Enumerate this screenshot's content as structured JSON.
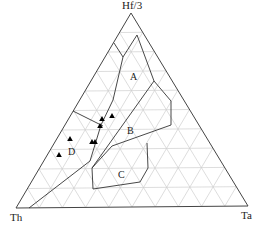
{
  "diagram": {
    "type": "ternary",
    "vertices": {
      "top": {
        "label": "Hf/3",
        "x": 131,
        "y": 13
      },
      "left": {
        "label": "Th",
        "x": 16,
        "y": 208
      },
      "right": {
        "label": "Ta",
        "x": 248,
        "y": 206
      }
    },
    "grid_divisions": 10,
    "fields": [
      {
        "label": "A",
        "lx": 130,
        "ly": 72
      },
      {
        "label": "B",
        "lx": 127,
        "ly": 126
      },
      {
        "label": "C",
        "lx": 118,
        "ly": 170
      },
      {
        "label": "D",
        "lx": 68,
        "ly": 147
      }
    ],
    "boundaries": [
      [
        [
          114,
          43
        ],
        [
          123,
          57
        ],
        [
          113,
          100
        ],
        [
          101,
          125
        ],
        [
          90,
          161
        ],
        [
          29,
          208
        ]
      ],
      [
        [
          137,
          35
        ],
        [
          154,
          81
        ],
        [
          171,
          101
        ],
        [
          171,
          125
        ],
        [
          112,
          146
        ],
        [
          92,
          168
        ]
      ],
      [
        [
          137,
          35
        ],
        [
          123,
          57
        ]
      ],
      [
        [
          73,
          111
        ],
        [
          103,
          126
        ]
      ],
      [
        [
          154,
          81
        ],
        [
          92,
          168
        ]
      ],
      [
        [
          147,
          143
        ],
        [
          148,
          168
        ],
        [
          140,
          182
        ],
        [
          93,
          189
        ],
        [
          92,
          168
        ]
      ]
    ],
    "samples": [
      {
        "x": 102,
        "y": 119
      },
      {
        "x": 112,
        "y": 116
      },
      {
        "x": 100,
        "y": 126
      },
      {
        "x": 92,
        "y": 142
      },
      {
        "x": 95,
        "y": 142
      },
      {
        "x": 70,
        "y": 139
      },
      {
        "x": 59,
        "y": 155
      }
    ]
  }
}
